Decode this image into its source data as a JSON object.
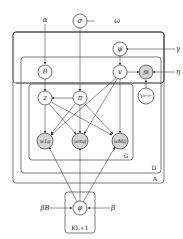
{
  "diagram": {
    "type": "plate-notation graphical model",
    "nodes": {
      "sigma": "σ",
      "omega": "ω",
      "alpha": "α",
      "theta": "θ",
      "psi": "ψ",
      "gamma": "γ",
      "v": "v",
      "fB": "fB",
      "eta": "η",
      "vprior": "Vᵖʳᶦᵒʳ",
      "z": "z",
      "pi": "π",
      "w1g": "w1g",
      "wmg": "wmg",
      "wMg": "wMg",
      "phi": "φ",
      "beta_B": "βB",
      "beta": "β"
    },
    "plates": {
      "A": "A",
      "D": "D",
      "G": "G",
      "KL": "KL+1"
    },
    "observed_nodes": [
      "fB",
      "w1g",
      "wmg",
      "wMg"
    ]
  }
}
